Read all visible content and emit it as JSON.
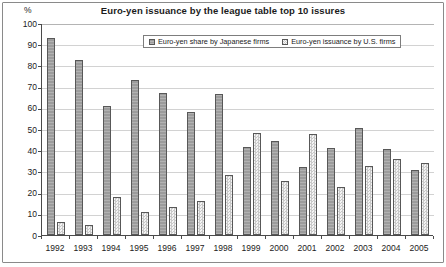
{
  "chart_data": {
    "type": "bar",
    "title": "Euro-yen issuance by the league table top 10 issures",
    "xlabel": "",
    "ylabel": "%",
    "ylim": [
      0,
      100
    ],
    "ytick_step": 10,
    "grid": true,
    "legend_position": "top-center-inside",
    "categories": [
      "1992",
      "1993",
      "1994",
      "1995",
      "1996",
      "1997",
      "1998",
      "1999",
      "2000",
      "2001",
      "2002",
      "2003",
      "2004",
      "2005"
    ],
    "yticks": [
      "0",
      "10",
      "20",
      "30",
      "40",
      "50",
      "60",
      "70",
      "80",
      "90",
      "100"
    ],
    "series": [
      {
        "name": "Euro-yen share by Japanese firms",
        "color": "#9c9c9c",
        "values": [
          93,
          82.5,
          61,
          73,
          67,
          58,
          66.5,
          41.5,
          44.5,
          32,
          41,
          50.5,
          40.5,
          30.5
        ]
      },
      {
        "name": "Euro-yen issuance by U.S. firms",
        "color": "#e9e9e9",
        "values": [
          6,
          4.5,
          18,
          11,
          13,
          16,
          28.5,
          48,
          25.5,
          47.5,
          22.5,
          32.5,
          36,
          34
        ]
      }
    ]
  }
}
